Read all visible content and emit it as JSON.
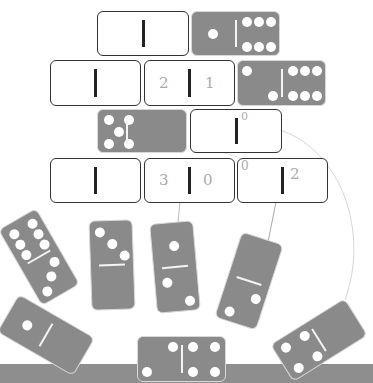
{
  "worksheet": {
    "title": "Domino addition puzzle",
    "colors": {
      "domino_gray": "#8a8a8a",
      "pip": "#ffffff",
      "floor": "#8e8e8e",
      "outline": "#333333"
    }
  },
  "pyramid": {
    "row1": [
      {
        "type": "blank",
        "left": "",
        "right": ""
      },
      {
        "type": "domino",
        "left": 1,
        "right": 6
      }
    ],
    "row2": [
      {
        "type": "blank",
        "left": "",
        "right": ""
      },
      {
        "type": "blank",
        "left": "2",
        "right": "1"
      },
      {
        "type": "domino",
        "left": 2,
        "right": 6
      }
    ],
    "row3": [
      {
        "type": "domino",
        "left": 5,
        "right": 0
      },
      {
        "type": "blank",
        "left": "",
        "right": "0"
      }
    ],
    "row4": [
      {
        "type": "blank",
        "left": "",
        "right": ""
      },
      {
        "type": "blank",
        "left": "3",
        "right": "0"
      },
      {
        "type": "blank",
        "left": "0",
        "right": "2"
      }
    ]
  },
  "handwriting": {
    "r2_left": "2",
    "r2_right": "1",
    "r3_right": "0",
    "r4b_left": "3",
    "r4b_right": "0",
    "r4c_left": "0",
    "r4c_right": "2"
  },
  "hanging_dominoes": [
    {
      "top": 6,
      "bottom": 3,
      "rotation": -30
    },
    {
      "top": 3,
      "bottom": 0,
      "rotation": -2
    },
    {
      "top": 1,
      "bottom": 2,
      "rotation": -5
    },
    {
      "top": 0,
      "bottom": 2,
      "rotation": 18
    }
  ],
  "floor_dominoes": [
    {
      "left": 1,
      "right": 0,
      "rotation": 30
    },
    {
      "left": 3,
      "right": 4,
      "rotation": 0
    },
    {
      "left": 4,
      "right": 0,
      "rotation": -32
    }
  ]
}
